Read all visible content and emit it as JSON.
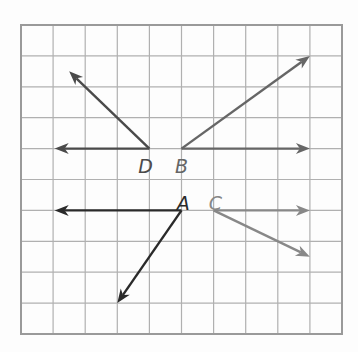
{
  "grid": {
    "columns": 10,
    "rows": 10,
    "origin_x": 21,
    "origin_y": 25,
    "cell_w": 32.1,
    "cell_h": 30.9,
    "line_color": "#b0b0b0",
    "border_color": "#9a9a9a"
  },
  "angles": [
    {
      "vertex_label": "D",
      "vertex": [
        4,
        4
      ],
      "label_pos": [
        3.65,
        4.55
      ],
      "color": "#4a4a4a",
      "rays": [
        [
          1.05,
          4
        ],
        [
          1.5,
          1.5
        ]
      ]
    },
    {
      "vertex_label": "B",
      "vertex": [
        5,
        4
      ],
      "label_pos": [
        4.8,
        4.55
      ],
      "color": "#666666",
      "rays": [
        [
          9,
          4
        ],
        [
          9,
          1
        ]
      ]
    },
    {
      "vertex_label": "A",
      "vertex": [
        5,
        6
      ],
      "label_pos": [
        4.85,
        5.75
      ],
      "color": "#2a2a2a",
      "rays": [
        [
          1.05,
          6
        ],
        [
          3,
          9
        ]
      ]
    },
    {
      "vertex_label": "C",
      "vertex": [
        6,
        6
      ],
      "label_pos": [
        5.85,
        5.75
      ],
      "color": "#888888",
      "rays": [
        [
          9,
          6
        ],
        [
          9,
          7.5
        ]
      ]
    }
  ]
}
